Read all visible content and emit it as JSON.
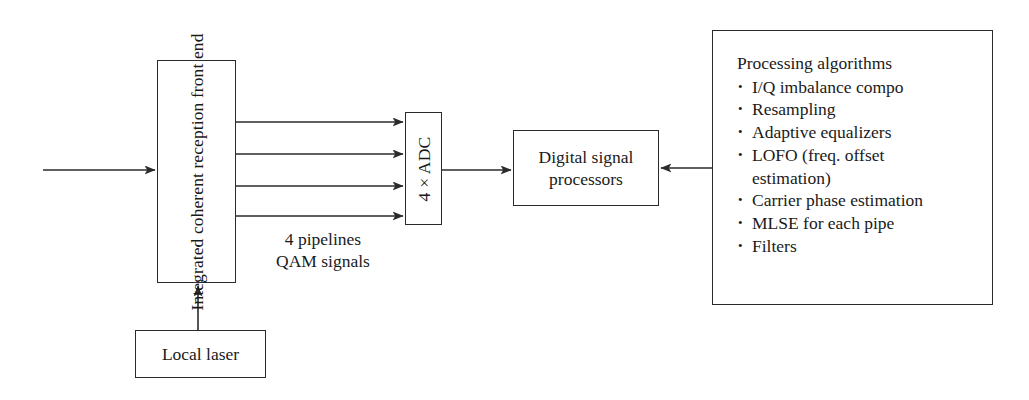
{
  "diagram": {
    "line_color": "#2b2b2b",
    "text_color": "#1a1a1a",
    "background": "#ffffff"
  },
  "blocks": {
    "frontend": {
      "label": "Integrated coherent\nreception front end"
    },
    "adc": {
      "label": "4 × ADC"
    },
    "dsp": {
      "label": "Digital signal\nprocessors"
    },
    "local_laser": {
      "label": "Local laser"
    },
    "algorithms": {
      "title": "Processing algorithms",
      "items": [
        "I/Q imbalance compo",
        "Resampling",
        "Adaptive equalizers",
        "LOFO (freq. offset\nestimation)",
        "Carrier phase estimation",
        "MLSE for each pipe",
        "Filters"
      ]
    }
  },
  "annotations": {
    "pipelines": "4 pipelines\nQAM signals"
  }
}
